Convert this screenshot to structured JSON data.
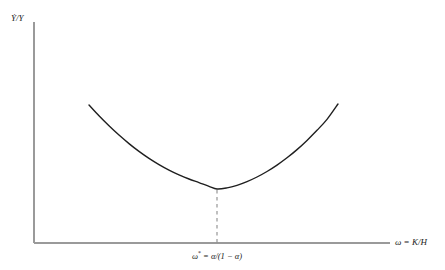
{
  "figure": {
    "background_color": "#ffffff",
    "width": 445,
    "height": 270
  },
  "axes": {
    "color": "#9a9a9a",
    "y_axis": {
      "x": 34,
      "y_top": 22,
      "y_bottom": 243
    },
    "x_axis": {
      "y": 243,
      "x_left": 34,
      "x_right": 390
    }
  },
  "labels": {
    "y_axis_label": "Ẏ/Y",
    "x_axis_label_prefix": "ω = ",
    "x_axis_label_fraction": "K/H",
    "x_tick_omega": "ω",
    "x_tick_star": "*",
    "x_tick_equation": " = α/(1 − α)"
  },
  "annotation": {
    "dashed_line_color": "#8c8c8c",
    "dashed_line_x": 217,
    "dashed_line_y_top": 190,
    "dashed_line_y_bottom": 243
  },
  "chart_data": {
    "type": "line",
    "title": "",
    "xlabel": "ω = K/H",
    "ylabel": "Ẏ/Y",
    "grid": false,
    "legend": "none",
    "curve_color": "#1f1f1f",
    "curve_width": 1.4,
    "xlim": [
      34,
      390
    ],
    "ylim": [
      243,
      22
    ],
    "minimum_point": {
      "x": 217,
      "y": 189
    },
    "endpoints": {
      "left": {
        "x": 89,
        "y": 105
      },
      "right": {
        "x": 338,
        "y": 104
      }
    },
    "points": [
      {
        "x": 89,
        "y": 105.0
      },
      {
        "x": 99,
        "y": 115.8
      },
      {
        "x": 109,
        "y": 125.8
      },
      {
        "x": 119,
        "y": 135.1
      },
      {
        "x": 129,
        "y": 143.6
      },
      {
        "x": 139,
        "y": 151.4
      },
      {
        "x": 149,
        "y": 158.4
      },
      {
        "x": 159,
        "y": 164.6
      },
      {
        "x": 169,
        "y": 170.1
      },
      {
        "x": 179,
        "y": 174.9
      },
      {
        "x": 189,
        "y": 179.0
      },
      {
        "x": 199,
        "y": 182.6
      },
      {
        "x": 209,
        "y": 186.3
      },
      {
        "x": 217,
        "y": 189.0
      },
      {
        "x": 227,
        "y": 187.9
      },
      {
        "x": 237,
        "y": 185.3
      },
      {
        "x": 247,
        "y": 181.6
      },
      {
        "x": 257,
        "y": 177.0
      },
      {
        "x": 267,
        "y": 171.5
      },
      {
        "x": 277,
        "y": 165.1
      },
      {
        "x": 287,
        "y": 157.8
      },
      {
        "x": 297,
        "y": 149.6
      },
      {
        "x": 307,
        "y": 140.4
      },
      {
        "x": 317,
        "y": 130.3
      },
      {
        "x": 327,
        "y": 119.4
      },
      {
        "x": 338,
        "y": 104.0
      }
    ],
    "xticks": [
      {
        "value": 217,
        "label": "ω* = α/(1 − α)"
      }
    ],
    "yticks": []
  }
}
